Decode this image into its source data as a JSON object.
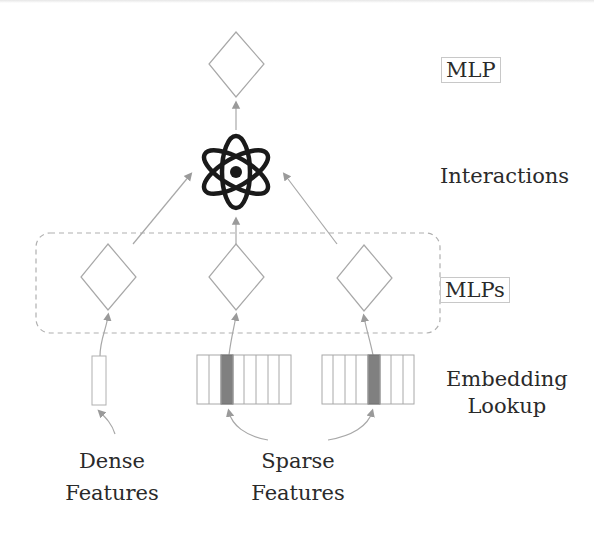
{
  "diagram": {
    "title_labels": {
      "mlp": "MLP",
      "interactions": "Interactions",
      "mlps": "MLPs",
      "embedding_line1": "Embedding",
      "embedding_line2": "Lookup",
      "dense_line1": "Dense",
      "dense_line2": "Features",
      "sparse_line1": "Sparse",
      "sparse_line2": "Features"
    },
    "nodes": {
      "top_mlp": {
        "shape": "diamond",
        "cx": 236,
        "cy": 64
      },
      "interaction": {
        "shape": "atom-icon",
        "cx": 236,
        "cy": 172
      },
      "bottom_mlps": [
        {
          "shape": "diamond",
          "cx": 108,
          "cy": 277
        },
        {
          "shape": "diamond",
          "cx": 236,
          "cy": 277
        },
        {
          "shape": "diamond",
          "cx": 364,
          "cy": 277
        }
      ]
    },
    "dense_vector": {
      "x": 92,
      "y": 356,
      "w": 14,
      "h": 49
    },
    "embedding_tables": [
      {
        "x": 197,
        "y": 355,
        "cells": 8,
        "cell_w": 11.7,
        "h": 49,
        "highlighted_index": 2
      },
      {
        "x": 322,
        "y": 355,
        "cells": 8,
        "cell_w": 11.5,
        "h": 49,
        "highlighted_index": 4
      }
    ],
    "colors": {
      "stroke": "#a8a8a8",
      "arrow": "#9a9a9a",
      "highlight": "#808080",
      "atom": "#1a1a1a",
      "text": "#2a2a2a",
      "dashed_group": "#b0b0b0"
    }
  }
}
